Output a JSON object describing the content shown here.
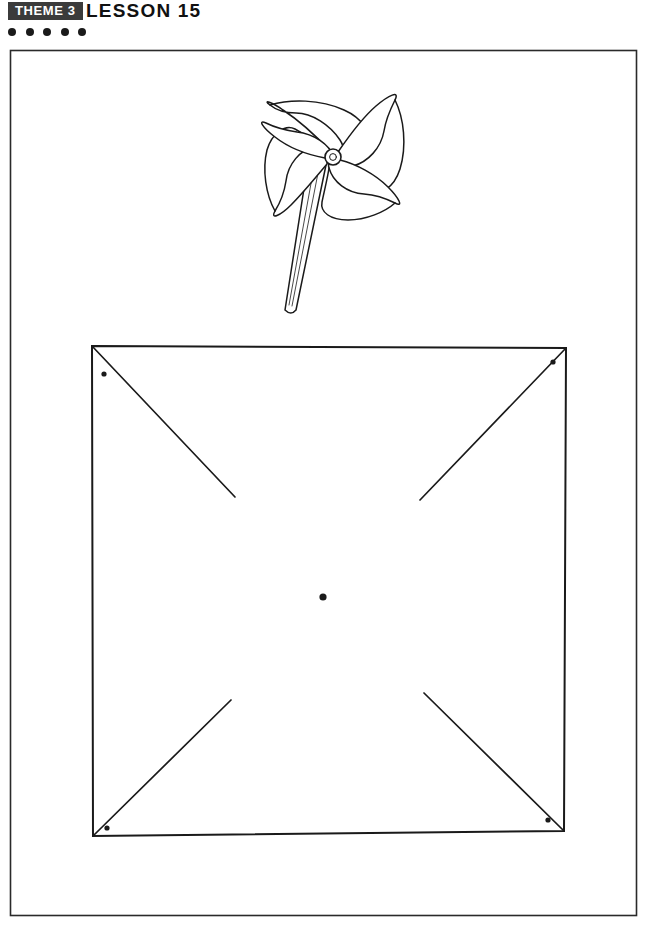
{
  "header": {
    "theme_badge": "THEME 3",
    "lesson_title": "LESSON  15",
    "badge_bg": "#3b3b3b",
    "badge_fg": "#ffffff",
    "text_color": "#111111",
    "dots": [
      {
        "name": "header-dot-1"
      },
      {
        "name": "header-dot-2"
      },
      {
        "name": "header-dot-3"
      },
      {
        "name": "header-dot-4"
      },
      {
        "name": "header-dot-5"
      }
    ]
  },
  "page": {
    "border_color": "#222222",
    "background": "#ffffff",
    "frame": {
      "x": 10,
      "y": 50,
      "width": 626,
      "height": 865
    }
  },
  "illustration": {
    "name": "pinwheel-drawing",
    "caption": "",
    "stroke_color": "#1a1a1a",
    "fill": "#ffffff"
  },
  "template": {
    "name": "pinwheel-square-template",
    "description": "Square with four diagonal cut lines from each corner toward the center and punch dots",
    "stroke_color": "#1a1a1a",
    "corners": [
      {
        "label": "top-left",
        "x": 92,
        "y": 346
      },
      {
        "label": "top-right",
        "x": 566,
        "y": 348
      },
      {
        "label": "bottom-right",
        "x": 564,
        "y": 831
      },
      {
        "label": "bottom-left",
        "x": 93,
        "y": 836
      }
    ],
    "center_dot": {
      "x": 323,
      "y": 597,
      "r": 3.6
    },
    "corner_dots": [
      {
        "label": "dot-top-left",
        "x": 104,
        "y": 374,
        "r": 2.6
      },
      {
        "label": "dot-top-right",
        "x": 553,
        "y": 362,
        "r": 2.6
      },
      {
        "label": "dot-bottom-right",
        "x": 548,
        "y": 820,
        "r": 2.6
      },
      {
        "label": "dot-bottom-left",
        "x": 107,
        "y": 828,
        "r": 2.6
      }
    ],
    "cut_lines": [
      {
        "label": "cut-from-top-left",
        "x1": 92,
        "y1": 346,
        "x2": 235,
        "y2": 497
      },
      {
        "label": "cut-from-top-right",
        "x1": 566,
        "y1": 348,
        "x2": 420,
        "y2": 500
      },
      {
        "label": "cut-from-bottom-right",
        "x1": 564,
        "y1": 831,
        "x2": 424,
        "y2": 693
      },
      {
        "label": "cut-from-bottom-left",
        "x1": 93,
        "y1": 836,
        "x2": 231,
        "y2": 700
      }
    ]
  }
}
